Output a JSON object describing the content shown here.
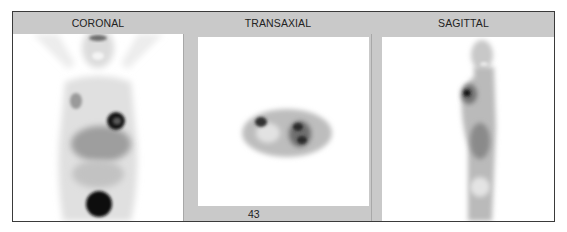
{
  "viewer": {
    "panels": [
      {
        "id": "coronal",
        "label": "CORONAL"
      },
      {
        "id": "transaxial",
        "label": "TRANSAXIAL",
        "slice_number": "43"
      },
      {
        "id": "sagittal",
        "label": "SAGITTAL"
      }
    ]
  },
  "colors": {
    "frame_gray": "#c9c9c9",
    "border": "#3a3a3a",
    "image_bg": "#ffffff",
    "uptake_dark": "#111111"
  }
}
